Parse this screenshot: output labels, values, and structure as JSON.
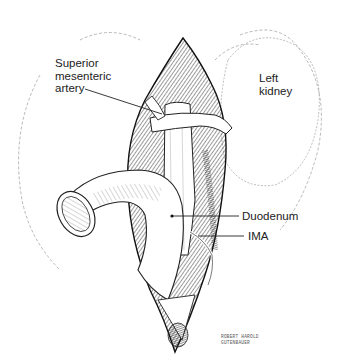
{
  "figure": {
    "type": "surgical-anatomy-illustration",
    "style": "black-and-white pen-and-ink",
    "labels": [
      {
        "id": "sma",
        "text": "Superior\nmesenteric\nartery"
      },
      {
        "id": "left_kidney",
        "text": "Left\nkidney"
      },
      {
        "id": "duodenum",
        "text": "Duodenum"
      },
      {
        "id": "ima",
        "text": "IMA"
      }
    ],
    "signature": "ROBERT HAROLD\nGUTENBAUER"
  }
}
